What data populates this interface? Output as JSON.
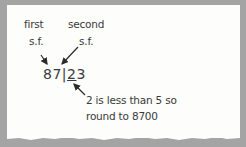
{
  "labels": {
    "first_line1": "first",
    "first_line2": "s.f.",
    "second_line1": "second",
    "second_line2": "s.f."
  },
  "number": {
    "before_bar": "87",
    "bar": "|",
    "underlined_digit": "2",
    "after": "3"
  },
  "note": {
    "line1": "2 is less than 5 so",
    "line2": "round to 8700"
  },
  "colors": {
    "background": "#a4a4a4",
    "card": "#fdfdfb",
    "ink": "#3a3a3a"
  }
}
